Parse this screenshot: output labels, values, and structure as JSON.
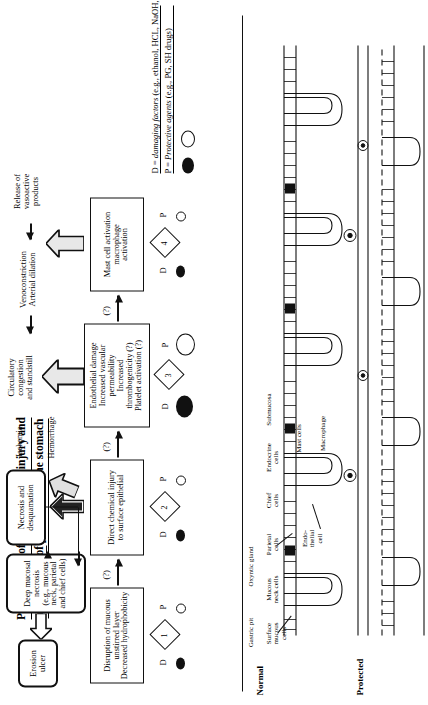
{
  "title": {
    "line1": "Pathogenesis of acute mucosal injury and",
    "line2": "mechanisms of protection in the stomach"
  },
  "flow": {
    "boxes": [
      {
        "id": 1,
        "label": "Disruption of mucous\nunstirred layer\nDecreased hydrophobicity"
      },
      {
        "id": 2,
        "label": "Direct chemical injury\nto surface epithelial"
      },
      {
        "id": 3,
        "label": "Endothelial damage\nIncreased vascular\npermeability\nIncreased\nthrombogenicity (?)\nPlatelet activation (?)"
      },
      {
        "id": 4,
        "label": "Mast cell activation\nmacrophage\nactivation"
      }
    ],
    "outcome_boxes": [
      {
        "name": "necrosis-desquamation",
        "label": "Necrosis and\ndesquamation"
      },
      {
        "name": "deep-mucosal-necrosis",
        "label": "Deep mucosal\nnecrosis\n(e.g., mucous\nneck, parietal\nand chief cells)"
      },
      {
        "name": "erosion-ulcer",
        "label": "Erosion\nulcer"
      }
    ],
    "mid_labels": [
      {
        "name": "circulatory-congestion",
        "label": "Circulatory\ncongestion\nand standstill"
      },
      {
        "name": "venoconstriction",
        "label": "Venoconstriction\nArterial dilation"
      },
      {
        "name": "release-vasoactive",
        "label": "Release of\nvasoactive\nproducts"
      },
      {
        "name": "ischemia",
        "label": "Ischemia"
      },
      {
        "name": "hemorrhage",
        "label": "Hemorrhage"
      }
    ],
    "question_marks": [
      "(?)",
      "(?)",
      "(?)"
    ],
    "dp_labels": {
      "d": "D",
      "p": "P"
    }
  },
  "legend": {
    "damaging": "D = damaging factors (e.g., ethanol, HCL, NaOH, aspirin)",
    "protective": "P = Protective agents (e.g., PG, SH drugs)",
    "damaging_key": "D = ",
    "damaging_em": "damaging factors",
    "damaging_rest": " (e.g., ethanol, HCL, NaOH, aspirin)",
    "protective_key": "P = ",
    "protective_em": "Protective agents",
    "protective_rest": " (e.g., PG, SH drugs)"
  },
  "anatomy": {
    "panels": [
      {
        "name": "normal",
        "label": "Normal"
      },
      {
        "name": "protected",
        "label": "Protected"
      }
    ],
    "labels": [
      {
        "name": "gastric-pit",
        "label": "Gastric pit"
      },
      {
        "name": "oxyntic-gland",
        "label": "Oxyntic gland"
      },
      {
        "name": "surface-mucous-cells",
        "label": "Surface\nmucous\ncells"
      },
      {
        "name": "mucous-neck-cells",
        "label": "Mucous\nneck cells"
      },
      {
        "name": "parietal-cells",
        "label": "Parietal\ncells"
      },
      {
        "name": "chief-cells",
        "label": "Chief\ncells"
      },
      {
        "name": "endocrine-cells",
        "label": "Endocrine\ncells"
      },
      {
        "name": "endothelial-cell",
        "label": "Endo-\nthelial\ncell"
      },
      {
        "name": "mast-cells",
        "label": "Mast cells"
      },
      {
        "name": "macrophage",
        "label": "Macrophage"
      },
      {
        "name": "submucosa",
        "label": "Submucosa"
      }
    ]
  },
  "colors": {
    "ink": "#111111",
    "paper": "#ffffff",
    "arrow_fill": "#efefef"
  }
}
